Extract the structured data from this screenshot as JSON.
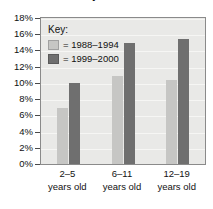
{
  "chart_data": {
    "type": "bar",
    "title": "and Obesity in U.S. Children",
    "xlabel": "",
    "ylabel": "",
    "ylim": [
      0,
      18
    ],
    "ytick_labels": [
      "18%",
      "16%",
      "14%",
      "12%",
      "10%",
      "8%",
      "6%",
      "4%",
      "2%",
      "0%"
    ],
    "ytick_values": [
      18,
      16,
      14,
      12,
      10,
      8,
      6,
      4,
      2,
      0
    ],
    "categories": [
      "2–5 years old",
      "6–11 years old",
      "12–19 years old"
    ],
    "category_lines": [
      {
        "line1": "2–5",
        "line2": "years old"
      },
      {
        "line1": "6–11",
        "line2": "years old"
      },
      {
        "line1": "12–19",
        "line2": "years old"
      }
    ],
    "series": [
      {
        "name": "1988–1994",
        "color": "#c6c6c4",
        "values": [
          6.9,
          10.9,
          10.4
        ]
      },
      {
        "name": "1999–2000",
        "color": "#6f6f6f",
        "values": [
          10.0,
          14.9,
          15.4
        ]
      }
    ],
    "legend": {
      "title": "Key:",
      "position": "inside-top-left",
      "entries": [
        {
          "marker": "light-swatch",
          "label": "= 1988–1994"
        },
        {
          "marker": "dark-swatch",
          "label": "= 1999–2000"
        }
      ]
    },
    "grid": true,
    "units": "percent"
  }
}
